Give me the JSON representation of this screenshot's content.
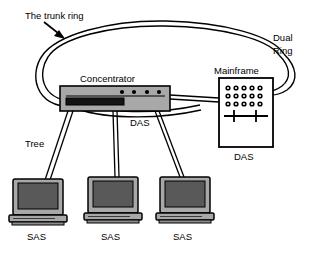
{
  "diagram": {
    "background_color": "#ffffff",
    "line_color": "#000000",
    "device_fill": "#a8a8a8",
    "screen_fill": "#595959",
    "mainframe_fill": "#ffffff",
    "labels": {
      "trunk_ring": "The trunk ring",
      "dual_ring_line1": "Dual",
      "dual_ring_line2": "Ring",
      "concentrator": "Concentrator",
      "mainframe": "Mainframe",
      "das_concentrator": "DAS",
      "das_mainframe": "DAS",
      "tree": "Tree",
      "sas_1": "SAS",
      "sas_2": "SAS",
      "sas_3": "SAS"
    },
    "nodes": [
      {
        "id": "concentrator",
        "type": "concentrator",
        "label": "Concentrator",
        "sublabel": "DAS",
        "indicator_count": 4
      },
      {
        "id": "mainframe",
        "type": "mainframe",
        "label": "Mainframe",
        "sublabel": "DAS",
        "dot_rows": 3,
        "dot_cols": 5
      },
      {
        "id": "station-1",
        "type": "workstation",
        "label": "SAS"
      },
      {
        "id": "station-2",
        "type": "workstation",
        "label": "SAS"
      },
      {
        "id": "station-3",
        "type": "workstation",
        "label": "SAS"
      }
    ],
    "links": [
      {
        "from": "ring",
        "to": "concentrator",
        "style": "dual"
      },
      {
        "from": "concentrator",
        "to": "mainframe",
        "style": "dual"
      },
      {
        "from": "ring",
        "to": "mainframe",
        "style": "dual"
      },
      {
        "from": "concentrator",
        "to": "station-1",
        "style": "dual",
        "label": "Tree"
      },
      {
        "from": "concentrator",
        "to": "station-2",
        "style": "dual"
      },
      {
        "from": "concentrator",
        "to": "station-3",
        "style": "dual"
      }
    ]
  }
}
